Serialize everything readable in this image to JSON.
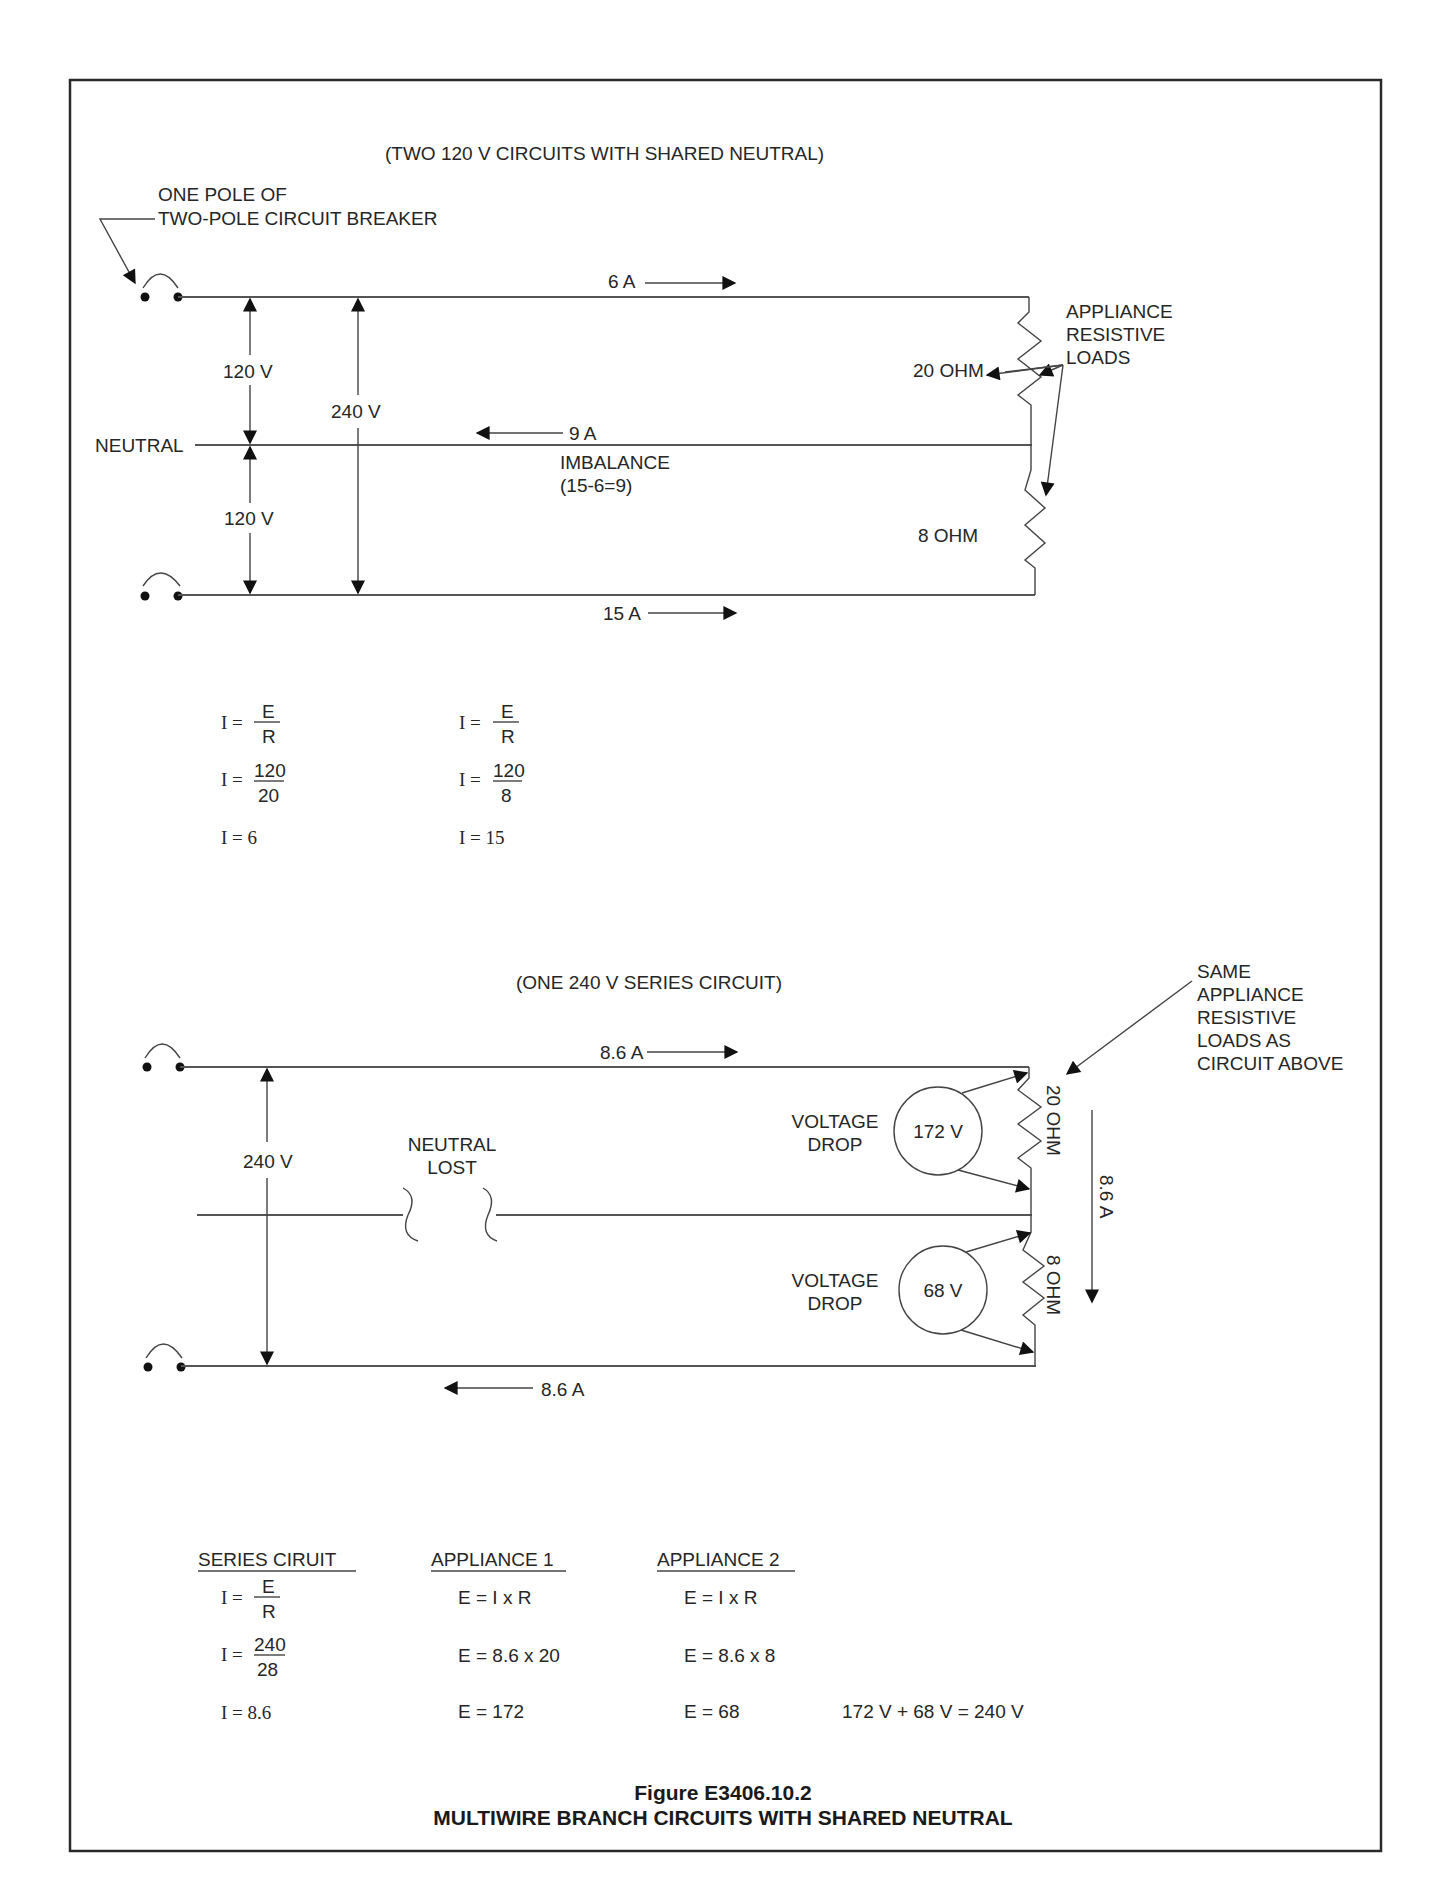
{
  "figure": {
    "number": "Figure E3406.10.2",
    "title": "MULTIWIRE BRANCH CIRCUITS WITH SHARED NEUTRAL"
  },
  "top_circuit": {
    "heading": "(TWO 120 V CIRCUITS WITH SHARED NEUTRAL)",
    "breaker_label_line1": "ONE POLE OF",
    "breaker_label_line2": "TWO-POLE CIRCUIT BREAKER",
    "current_top": "6 A",
    "current_bottom": "15 A",
    "neutral_current": "9 A",
    "imbalance_line1": "IMBALANCE",
    "imbalance_line2": "(15-6=9)",
    "neutral_label": "NEUTRAL",
    "voltage_upper": "120 V",
    "voltage_lower": "120 V",
    "voltage_total": "240 V",
    "load1": "20 OHM",
    "load2": "8 OHM",
    "loads_label_line1": "APPLIANCE",
    "loads_label_line2": "RESISTIVE",
    "loads_label_line3": "LOADS"
  },
  "top_calcs": {
    "left": {
      "r1_lhs": "I =",
      "r1_num": "E",
      "r1_den": "R",
      "r2_lhs": "I =",
      "r2_num": "120",
      "r2_den": "20",
      "r3": "I =  6"
    },
    "right": {
      "r1_lhs": "I =",
      "r1_num": "E",
      "r1_den": "R",
      "r2_lhs": "I =",
      "r2_num": "120",
      "r2_den": "8",
      "r3": "I = 15"
    }
  },
  "bottom_circuit": {
    "heading": "(ONE 240 V SERIES CIRCUIT)",
    "same_loads_line1": "SAME",
    "same_loads_line2": "APPLIANCE",
    "same_loads_line3": "RESISTIVE",
    "same_loads_line4": "LOADS AS",
    "same_loads_line5": "CIRCUIT ABOVE",
    "current_top": "8.6 A",
    "current_bottom": "8.6 A",
    "current_vertical": "8.6 A",
    "voltage_total": "240 V",
    "neutral_lost_line1": "NEUTRAL",
    "neutral_lost_line2": "LOST",
    "drop1_label_line1": "VOLTAGE",
    "drop1_label_line2": "DROP",
    "drop1_value": "172 V",
    "drop2_label_line1": "VOLTAGE",
    "drop2_label_line2": "DROP",
    "drop2_value": "68 V",
    "load1": "20 OHM",
    "load2": "8 OHM"
  },
  "bottom_calcs": {
    "series": {
      "heading": "SERIES CIRUIT",
      "r1_lhs": "I =",
      "r1_num": "E",
      "r1_den": "R",
      "r2_lhs": "I =",
      "r2_num": "240",
      "r2_den": "28",
      "r3": "I =  8.6"
    },
    "appliance1": {
      "heading": "APPLIANCE 1",
      "r1": "E = I x R",
      "r2": "E = 8.6 x 20",
      "r3": "E = 172"
    },
    "appliance2": {
      "heading": "APPLIANCE 2",
      "r1": "E = I x R",
      "r2": "E = 8.6 x 8",
      "r3": "E = 68"
    },
    "total": "172 V + 68 V = 240 V"
  },
  "colors": {
    "line": "#555555",
    "text": "#262626",
    "frame": "#2a2a2a",
    "background": "#ffffff"
  }
}
